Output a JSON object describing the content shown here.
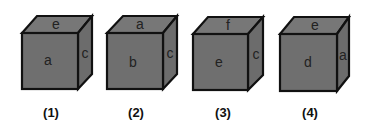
{
  "diagram": {
    "type": "cube-views",
    "colors": {
      "face": "#6f6f6f",
      "edge": "#111111",
      "background": "#ffffff"
    },
    "cubes": [
      {
        "caption": "(1)",
        "front": "a",
        "top": "e",
        "right": "c"
      },
      {
        "caption": "(2)",
        "front": "b",
        "top": "a",
        "right": "c"
      },
      {
        "caption": "(3)",
        "front": "e",
        "top": "f",
        "right": "c"
      },
      {
        "caption": "(4)",
        "front": "d",
        "top": "e",
        "right": "a"
      }
    ]
  }
}
